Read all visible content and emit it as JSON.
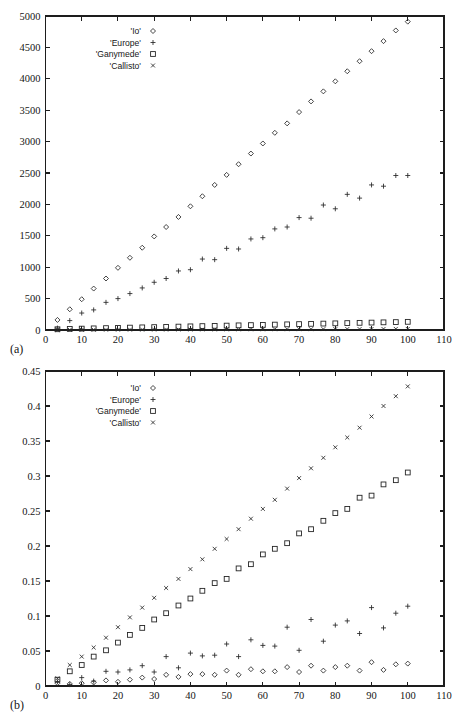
{
  "figure": {
    "panels": [
      {
        "id": "a",
        "panel_label": "(a)"
      },
      {
        "id": "b",
        "panel_label": "(b)"
      }
    ]
  },
  "chart_data": [
    {
      "type": "scatter",
      "panel": "(a)",
      "title": "",
      "xlabel": "",
      "ylabel": "",
      "xlim": [
        0,
        110
      ],
      "ylim": [
        0,
        5000
      ],
      "xticks": [
        0,
        10,
        20,
        30,
        40,
        50,
        60,
        70,
        80,
        90,
        100,
        110
      ],
      "yticks": [
        0,
        500,
        1000,
        1500,
        2000,
        2500,
        3000,
        3500,
        4000,
        4500,
        5000
      ],
      "xtick_labels": [
        "0",
        "10",
        "20",
        "30",
        "40",
        "50",
        "60",
        "70",
        "80",
        "90",
        "100",
        "110"
      ],
      "ytick_labels": [
        "0",
        "500",
        "1000",
        "1500",
        "2000",
        "2500",
        "3000",
        "3500",
        "4000",
        "4500",
        "5000"
      ],
      "grid": false,
      "legend_position": "upper-left",
      "series": [
        {
          "name": "'Io'",
          "marker": "diamond",
          "x": [
            3.3,
            6.7,
            10,
            13.3,
            16.7,
            20,
            23.3,
            26.7,
            30,
            33.3,
            36.7,
            40,
            43.3,
            46.7,
            50,
            53.3,
            56.7,
            60,
            63.3,
            66.7,
            70,
            73.3,
            76.7,
            80,
            83.3,
            86.7,
            90,
            93.3,
            96.7,
            100
          ],
          "values": [
            160,
            330,
            490,
            660,
            820,
            990,
            1150,
            1310,
            1490,
            1640,
            1800,
            1970,
            2130,
            2310,
            2470,
            2640,
            2810,
            2970,
            3140,
            3290,
            3470,
            3640,
            3800,
            3960,
            4120,
            4280,
            4440,
            4600,
            4770,
            4910
          ]
        },
        {
          "name": "'Europe'",
          "marker": "plus",
          "x": [
            3.3,
            6.7,
            10,
            13.3,
            16.7,
            20,
            23.3,
            26.7,
            30,
            33.3,
            36.7,
            40,
            43.3,
            46.7,
            50,
            53.3,
            56.7,
            60,
            63.3,
            66.7,
            70,
            73.3,
            76.7,
            80,
            83.3,
            86.7,
            90,
            93.3,
            96.7,
            100
          ],
          "values": [
            30,
            150,
            270,
            320,
            440,
            500,
            580,
            670,
            760,
            820,
            940,
            960,
            1130,
            1120,
            1300,
            1290,
            1450,
            1470,
            1610,
            1640,
            1790,
            1780,
            1990,
            1930,
            2160,
            2100,
            2310,
            2290,
            2460,
            2460
          ]
        },
        {
          "name": "'Ganymede'",
          "marker": "square",
          "x": [
            3.3,
            6.7,
            10,
            13.3,
            16.7,
            20,
            23.3,
            26.7,
            30,
            33.3,
            36.7,
            40,
            43.3,
            46.7,
            50,
            53.3,
            56.7,
            60,
            63.3,
            66.7,
            70,
            73.3,
            76.7,
            80,
            83.3,
            86.7,
            90,
            93.3,
            96.7,
            100
          ],
          "values": [
            12,
            18,
            22,
            26,
            30,
            34,
            38,
            42,
            46,
            50,
            54,
            58,
            62,
            66,
            70,
            74,
            78,
            82,
            86,
            90,
            94,
            98,
            102,
            106,
            110,
            114,
            118,
            122,
            126,
            130
          ]
        },
        {
          "name": "'Callisto'",
          "marker": "cross",
          "x": [
            3.3,
            6.7,
            10,
            13.3,
            16.7,
            20,
            23.3,
            26.7,
            30,
            33.3,
            36.7,
            40,
            43.3,
            46.7,
            50,
            53.3,
            56.7,
            60,
            63.3,
            66.7,
            70,
            73.3,
            76.7,
            80,
            83.3,
            86.7,
            90,
            93.3,
            96.7,
            100
          ],
          "values": [
            2,
            3,
            4,
            4,
            5,
            5,
            6,
            6,
            7,
            7,
            8,
            8,
            9,
            9,
            10,
            10,
            11,
            11,
            12,
            12,
            13,
            13,
            14,
            14,
            15,
            15,
            16,
            16,
            17,
            17
          ]
        }
      ]
    },
    {
      "type": "scatter",
      "panel": "(b)",
      "title": "",
      "xlabel": "",
      "ylabel": "",
      "xlim": [
        0,
        110
      ],
      "ylim": [
        0,
        0.45
      ],
      "xticks": [
        0,
        10,
        20,
        30,
        40,
        50,
        60,
        70,
        80,
        90,
        100,
        110
      ],
      "yticks": [
        0,
        0.05,
        0.1,
        0.15,
        0.2,
        0.25,
        0.3,
        0.35,
        0.4,
        0.45
      ],
      "xtick_labels": [
        "0",
        "10",
        "20",
        "30",
        "40",
        "50",
        "60",
        "70",
        "80",
        "90",
        "100",
        "110"
      ],
      "ytick_labels": [
        "0",
        "0.05",
        "0.1",
        "0.15",
        "0.2",
        "0.25",
        "0.3",
        "0.35",
        "0.4",
        "0.45"
      ],
      "grid": false,
      "legend_position": "upper-left",
      "series": [
        {
          "name": "'Io'",
          "marker": "diamond",
          "x": [
            3.3,
            6.7,
            10,
            13.3,
            16.7,
            20,
            23.3,
            26.7,
            30,
            33.3,
            36.7,
            40,
            43.3,
            46.7,
            50,
            53.3,
            56.7,
            60,
            63.3,
            66.7,
            70,
            73.3,
            76.7,
            80,
            83.3,
            86.7,
            90,
            93.3,
            96.7,
            100
          ],
          "values": [
            0.004,
            0.003,
            0.004,
            0.005,
            0.008,
            0.006,
            0.009,
            0.012,
            0.01,
            0.016,
            0.013,
            0.017,
            0.017,
            0.016,
            0.022,
            0.016,
            0.024,
            0.021,
            0.021,
            0.027,
            0.02,
            0.029,
            0.022,
            0.027,
            0.029,
            0.022,
            0.034,
            0.023,
            0.031,
            0.032
          ]
        },
        {
          "name": "'Europe'",
          "marker": "plus",
          "x": [
            3.3,
            6.7,
            10,
            13.3,
            16.7,
            20,
            23.3,
            26.7,
            30,
            33.3,
            36.7,
            40,
            43.3,
            46.7,
            50,
            53.3,
            56.7,
            60,
            63.3,
            66.7,
            70,
            73.3,
            76.7,
            80,
            83.3,
            86.7,
            90,
            93.3,
            96.7,
            100
          ],
          "values": [
            0.006,
            0.002,
            0.012,
            0.007,
            0.021,
            0.02,
            0.023,
            0.029,
            0.02,
            0.042,
            0.026,
            0.047,
            0.043,
            0.044,
            0.06,
            0.042,
            0.066,
            0.058,
            0.057,
            0.084,
            0.051,
            0.095,
            0.064,
            0.087,
            0.093,
            0.075,
            0.112,
            0.083,
            0.104,
            0.114
          ]
        },
        {
          "name": "'Ganymede'",
          "marker": "square",
          "x": [
            3.3,
            6.7,
            10,
            13.3,
            16.7,
            20,
            23.3,
            26.7,
            30,
            33.3,
            36.7,
            40,
            43.3,
            46.7,
            50,
            53.3,
            56.7,
            60,
            63.3,
            66.7,
            70,
            73.3,
            76.7,
            80,
            83.3,
            86.7,
            90,
            93.3,
            96.7,
            100
          ],
          "values": [
            0.009,
            0.021,
            0.03,
            0.042,
            0.051,
            0.062,
            0.073,
            0.083,
            0.095,
            0.104,
            0.115,
            0.125,
            0.136,
            0.147,
            0.153,
            0.168,
            0.174,
            0.188,
            0.196,
            0.204,
            0.218,
            0.224,
            0.236,
            0.247,
            0.253,
            0.269,
            0.272,
            0.288,
            0.294,
            0.305
          ]
        },
        {
          "name": "'Callisto'",
          "marker": "cross",
          "x": [
            3.3,
            6.7,
            10,
            13.3,
            16.7,
            20,
            23.3,
            26.7,
            30,
            33.3,
            36.7,
            40,
            43.3,
            46.7,
            50,
            53.3,
            56.7,
            60,
            63.3,
            66.7,
            70,
            73.3,
            76.7,
            80,
            83.3,
            86.7,
            90,
            93.3,
            96.7,
            100
          ],
          "values": [
            0.011,
            0.03,
            0.042,
            0.055,
            0.069,
            0.084,
            0.098,
            0.112,
            0.126,
            0.14,
            0.153,
            0.167,
            0.181,
            0.196,
            0.21,
            0.224,
            0.239,
            0.253,
            0.266,
            0.282,
            0.297,
            0.311,
            0.326,
            0.341,
            0.355,
            0.369,
            0.385,
            0.4,
            0.414,
            0.428
          ]
        }
      ]
    }
  ]
}
